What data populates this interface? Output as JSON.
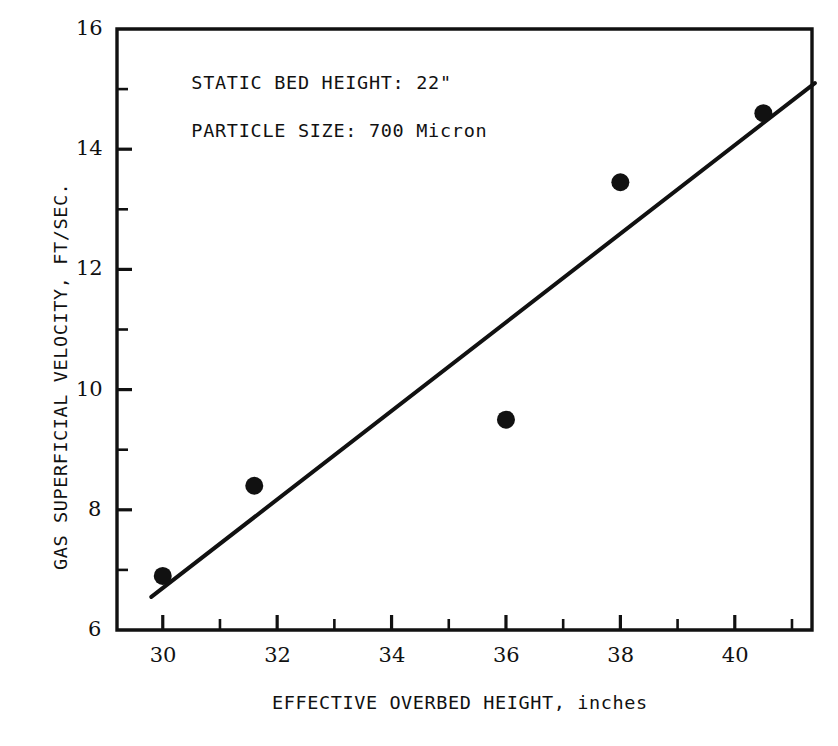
{
  "chart_data": {
    "type": "scatter",
    "title": "",
    "xlabel": "EFFECTIVE OVERBED HEIGHT, inches",
    "ylabel": "GAS SUPERFICIAL VELOCITY, FT/SEC.",
    "xlim": [
      29.2,
      41.35
    ],
    "ylim": [
      6,
      16
    ],
    "grid": false,
    "legend": null,
    "x_ticks_major": [
      30,
      32,
      34,
      36,
      38,
      40
    ],
    "x_ticks_minor": [
      31,
      33,
      35,
      37,
      39,
      41
    ],
    "x_tick_labels": [
      "30",
      "32",
      "34",
      "36",
      "38",
      "40"
    ],
    "y_ticks_major": [
      6,
      8,
      10,
      12,
      14,
      16
    ],
    "y_ticks_minor": [
      7,
      9,
      11,
      13,
      15
    ],
    "y_tick_labels": [
      "6",
      "8",
      "10",
      "12",
      "14",
      "16"
    ],
    "series": [
      {
        "name": "measured points",
        "marker": "filled-circle",
        "color": "#111111",
        "points": [
          {
            "x": 30.0,
            "y": 6.9
          },
          {
            "x": 31.6,
            "y": 8.4
          },
          {
            "x": 36.0,
            "y": 9.5
          },
          {
            "x": 38.0,
            "y": 13.45
          },
          {
            "x": 40.5,
            "y": 14.6
          }
        ]
      },
      {
        "name": "fitted trend line",
        "marker": "none",
        "color": "#111111",
        "points": [
          {
            "x": 29.8,
            "y": 6.55
          },
          {
            "x": 41.4,
            "y": 15.1
          }
        ]
      }
    ],
    "annotations": [
      {
        "text": "STATIC BED HEIGHT: 22\"",
        "x": 30.5,
        "y": 15.1
      },
      {
        "text": "PARTICLE SIZE: 700 Micron",
        "x": 30.5,
        "y": 14.3
      }
    ]
  },
  "figure": {
    "background_color": "#ffffff",
    "ink_color": "#111111"
  }
}
